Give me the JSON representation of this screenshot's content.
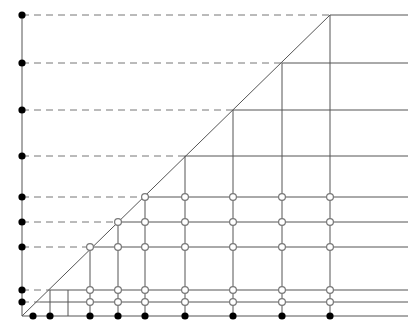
{
  "figure": {
    "title": "",
    "type": "lattice-staircase-diagram",
    "width": 420,
    "height": 332,
    "background_color": "#ffffff"
  },
  "chart_data": {
    "type": "scatter",
    "title": "",
    "xlabel": "",
    "ylabel": "",
    "grid": true,
    "legend": false,
    "xlim": [
      0,
      420
    ],
    "ylim": [
      0,
      332
    ],
    "origin": {
      "x": 22,
      "y": 316
    },
    "axes": {
      "y_axis": {
        "x": 22,
        "y_top": 15,
        "y_bottom": 316,
        "color": "#555555",
        "width": 1
      },
      "x_axis": {
        "y": 316,
        "x_left": 22,
        "x_right": 408,
        "color": "#555555",
        "width": 1
      }
    },
    "diagonal": {
      "x1": 22,
      "y1": 316,
      "x2": 330,
      "y2": 15,
      "color": "#555555",
      "width": 1,
      "description": "staircase boundary line from origin to top corner"
    },
    "y_levels": [
      15,
      63,
      110,
      156,
      197,
      222,
      247,
      290,
      302
    ],
    "x_levels": [
      50,
      68,
      90,
      118,
      145,
      185,
      233,
      282,
      330
    ],
    "horizontal_lines": [
      {
        "y": 15,
        "dashed_from": 22,
        "dashed_to": 330,
        "solid_from": 330,
        "solid_to": 408
      },
      {
        "y": 63,
        "dashed_from": 22,
        "dashed_to": 282,
        "solid_from": 282,
        "solid_to": 408
      },
      {
        "y": 110,
        "dashed_from": 22,
        "dashed_to": 233,
        "solid_from": 233,
        "solid_to": 408
      },
      {
        "y": 156,
        "dashed_from": 22,
        "dashed_to": 185,
        "solid_from": 185,
        "solid_to": 408
      },
      {
        "y": 197,
        "dashed_from": 22,
        "dashed_to": 145,
        "solid_from": 145,
        "solid_to": 408
      },
      {
        "y": 222,
        "dashed_from": 22,
        "dashed_to": 118,
        "solid_from": 118,
        "solid_to": 408
      },
      {
        "y": 247,
        "dashed_from": 22,
        "dashed_to": 90,
        "solid_from": 90,
        "solid_to": 408
      },
      {
        "y": 290,
        "dashed_from": 22,
        "dashed_to": 50,
        "solid_from": 50,
        "solid_to": 408
      },
      {
        "y": 302,
        "dashed_from": 22,
        "dashed_to": 40,
        "solid_from": 40,
        "solid_to": 408
      }
    ],
    "vertical_lines": [
      {
        "x": 50,
        "y_top": 290,
        "y_bottom": 316
      },
      {
        "x": 68,
        "y_top": 290,
        "y_bottom": 316
      },
      {
        "x": 90,
        "y_top": 247,
        "y_bottom": 316
      },
      {
        "x": 118,
        "y_top": 222,
        "y_bottom": 316
      },
      {
        "x": 145,
        "y_top": 197,
        "y_bottom": 316
      },
      {
        "x": 185,
        "y_top": 156,
        "y_bottom": 316
      },
      {
        "x": 233,
        "y_top": 110,
        "y_bottom": 316
      },
      {
        "x": 282,
        "y_top": 63,
        "y_bottom": 316
      },
      {
        "x": 330,
        "y_top": 15,
        "y_bottom": 316
      }
    ],
    "filled_points_y_axis": [
      {
        "x": 22,
        "y": 15
      },
      {
        "x": 22,
        "y": 63
      },
      {
        "x": 22,
        "y": 110
      },
      {
        "x": 22,
        "y": 156
      },
      {
        "x": 22,
        "y": 197
      },
      {
        "x": 22,
        "y": 222
      },
      {
        "x": 22,
        "y": 247
      },
      {
        "x": 22,
        "y": 290
      },
      {
        "x": 22,
        "y": 302
      }
    ],
    "filled_points_x_axis": [
      {
        "x": 33,
        "y": 316
      },
      {
        "x": 50,
        "y": 316
      },
      {
        "x": 90,
        "y": 316
      },
      {
        "x": 118,
        "y": 316
      },
      {
        "x": 145,
        "y": 316
      },
      {
        "x": 185,
        "y": 316
      },
      {
        "x": 233,
        "y": 316
      },
      {
        "x": 282,
        "y": 316
      },
      {
        "x": 330,
        "y": 316
      }
    ],
    "open_points": [
      {
        "x": 90,
        "y": 290
      },
      {
        "x": 118,
        "y": 290
      },
      {
        "x": 145,
        "y": 290
      },
      {
        "x": 185,
        "y": 290
      },
      {
        "x": 233,
        "y": 290
      },
      {
        "x": 282,
        "y": 290
      },
      {
        "x": 330,
        "y": 290
      },
      {
        "x": 90,
        "y": 302
      },
      {
        "x": 118,
        "y": 302
      },
      {
        "x": 145,
        "y": 302
      },
      {
        "x": 185,
        "y": 302
      },
      {
        "x": 233,
        "y": 302
      },
      {
        "x": 282,
        "y": 302
      },
      {
        "x": 330,
        "y": 302
      },
      {
        "x": 90,
        "y": 247
      },
      {
        "x": 118,
        "y": 247
      },
      {
        "x": 145,
        "y": 247
      },
      {
        "x": 185,
        "y": 247
      },
      {
        "x": 233,
        "y": 247
      },
      {
        "x": 282,
        "y": 247
      },
      {
        "x": 330,
        "y": 247
      },
      {
        "x": 118,
        "y": 222
      },
      {
        "x": 145,
        "y": 222
      },
      {
        "x": 185,
        "y": 222
      },
      {
        "x": 233,
        "y": 222
      },
      {
        "x": 282,
        "y": 222
      },
      {
        "x": 330,
        "y": 222
      },
      {
        "x": 145,
        "y": 197
      },
      {
        "x": 185,
        "y": 197
      },
      {
        "x": 233,
        "y": 197
      },
      {
        "x": 282,
        "y": 197
      },
      {
        "x": 330,
        "y": 197
      }
    ],
    "styles": {
      "line_color": "#555555",
      "dash_color": "#777777",
      "filled_dot_color": "#000000",
      "open_dot_stroke": "#777777",
      "open_dot_fill": "#ffffff",
      "filled_dot_radius": 3.6,
      "open_dot_radius": 3.4,
      "dash_pattern": "7,5"
    }
  }
}
